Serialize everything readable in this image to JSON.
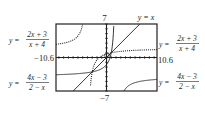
{
  "chart_data": {
    "type": "line",
    "title": "",
    "xlabel": "",
    "ylabel": "",
    "xlim": [
      -10.6,
      10.6
    ],
    "ylim": [
      -7,
      7
    ],
    "grid": false,
    "axis_ticks": "unit tick marks on both axes",
    "window_labels": {
      "ymax": "7",
      "ymin": "−7",
      "xmin": "−10.6",
      "xmax": "10.6"
    },
    "series": [
      {
        "name": "y = (2x + 3)/(x + 4)",
        "style": "dotted",
        "asymptotes": {
          "vertical": -4,
          "horizontal": 2
        },
        "points_left_branch": [
          [
            -10.6,
            2.76
          ],
          [
            -8,
            3.25
          ],
          [
            -6,
            4.5
          ],
          [
            -5,
            7
          ]
        ],
        "points_right_branch": [
          [
            -3.5,
            -8
          ],
          [
            -3,
            -3
          ],
          [
            -2,
            -0.5
          ],
          [
            0,
            0.75
          ],
          [
            2,
            1.17
          ],
          [
            5,
            1.44
          ],
          [
            10.6,
            1.66
          ]
        ]
      },
      {
        "name": "y = (4x − 3)/(2 − x)",
        "style": "solid",
        "asymptotes": {
          "vertical": 2,
          "horizontal": -4
        },
        "points_left_branch": [
          [
            -10.6,
            -3.6
          ],
          [
            -6,
            -3.375
          ],
          [
            -4,
            -3.17
          ],
          [
            -2,
            -2.75
          ],
          [
            0,
            -1.5
          ],
          [
            1,
            1
          ],
          [
            1.25,
            2.67
          ]
        ],
        "points_right_branch": [
          [
            3,
            -9
          ],
          [
            4,
            -6.5
          ],
          [
            6,
            -5.25
          ],
          [
            10.6,
            -4.58
          ]
        ]
      },
      {
        "name": "y = x",
        "style": "solid",
        "points": [
          [
            -7,
            -7
          ],
          [
            7,
            7
          ]
        ]
      }
    ],
    "legend_labels": [
      {
        "text": "y = (2x + 3)/(x + 4)",
        "position": "left-upper"
      },
      {
        "text": "y = (2x + 3)/(x + 4)",
        "position": "right-upper"
      },
      {
        "text": "y = (4x − 3)/(2 − x)",
        "position": "left-lower"
      },
      {
        "text": "y = (4x − 3)/(2 − x)",
        "position": "right-lower"
      },
      {
        "text": "y = x",
        "position": "top-right"
      }
    ]
  },
  "labels": {
    "ymax": "7",
    "ymin": "−7",
    "xmin": "−10.6",
    "xmax": "10.6",
    "yx": "y = x",
    "f1_lhs": "y =",
    "f1_num": "2x + 3",
    "f1_den": "x + 4",
    "f2_lhs": "y =",
    "f2_num": "4x − 3",
    "f2_den": "2 − x"
  }
}
